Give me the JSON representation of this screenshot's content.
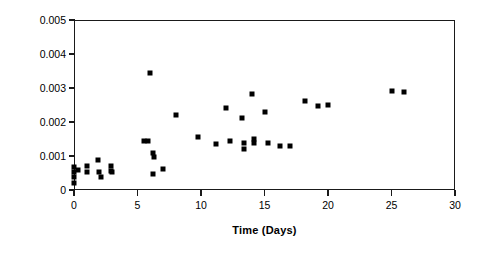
{
  "chart_data": {
    "type": "scatter",
    "title": "",
    "xlabel": "Time (Days)",
    "ylabel": "B (1/µA)",
    "xlim": [
      0,
      30
    ],
    "ylim": [
      0,
      0.005
    ],
    "grid": false,
    "legend": false,
    "marker": "filled-square",
    "marker_color": "#000000",
    "xticks": [
      0,
      5,
      10,
      15,
      20,
      25,
      30
    ],
    "xtick_labels": [
      "0",
      "5",
      "10",
      "15",
      "20",
      "25",
      "30"
    ],
    "yticks": [
      0,
      0.001,
      0.002,
      0.003,
      0.004,
      0.005
    ],
    "ytick_labels": [
      "0",
      "0.001",
      "0.002",
      "0.003",
      "0.004",
      "0.005"
    ],
    "series": [
      {
        "name": "B",
        "points": [
          [
            0.0,
            0.00068
          ],
          [
            0.0,
            0.00052
          ],
          [
            0.0,
            0.00038
          ],
          [
            0.0,
            0.0002
          ],
          [
            0.3,
            0.0006
          ],
          [
            1.0,
            0.0007
          ],
          [
            1.0,
            0.00052
          ],
          [
            1.9,
            0.00088
          ],
          [
            2.0,
            0.00052
          ],
          [
            2.1,
            0.00038
          ],
          [
            2.9,
            0.00072
          ],
          [
            2.9,
            0.00055
          ],
          [
            3.0,
            0.00052
          ],
          [
            5.5,
            0.00143
          ],
          [
            5.8,
            0.00143
          ],
          [
            6.0,
            0.00345
          ],
          [
            6.2,
            0.0011
          ],
          [
            6.3,
            0.00098
          ],
          [
            6.2,
            0.00047
          ],
          [
            7.0,
            0.00062
          ],
          [
            8.0,
            0.00222
          ],
          [
            9.8,
            0.00155
          ],
          [
            11.2,
            0.00136
          ],
          [
            12.0,
            0.0024
          ],
          [
            12.3,
            0.00143
          ],
          [
            13.2,
            0.00212
          ],
          [
            13.4,
            0.00137
          ],
          [
            13.4,
            0.0012
          ],
          [
            14.0,
            0.00281
          ],
          [
            14.2,
            0.0015
          ],
          [
            14.2,
            0.00138
          ],
          [
            15.0,
            0.00228
          ],
          [
            15.3,
            0.00137
          ],
          [
            16.2,
            0.0013
          ],
          [
            17.0,
            0.0013
          ],
          [
            18.2,
            0.00262
          ],
          [
            19.2,
            0.00247
          ],
          [
            20.0,
            0.0025
          ],
          [
            25.0,
            0.0029
          ],
          [
            26.0,
            0.00288
          ]
        ]
      }
    ]
  },
  "axes": {
    "y_title": "B (1/µA)",
    "x_title": "Time (Days)"
  }
}
